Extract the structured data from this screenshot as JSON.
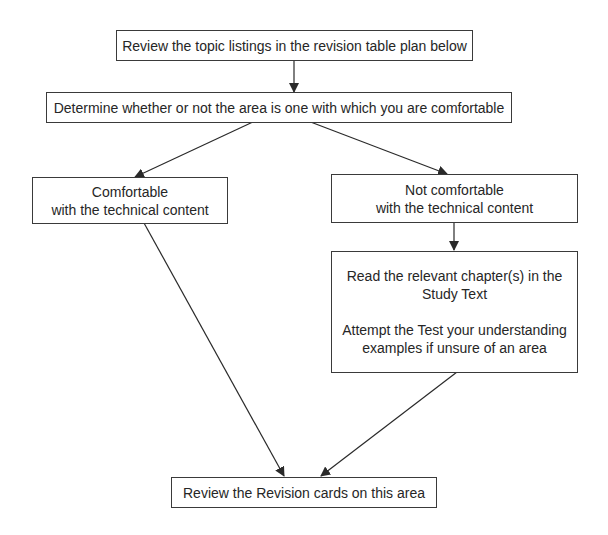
{
  "diagram": {
    "type": "flowchart",
    "colors": {
      "background": "#ffffff",
      "border": "#3a3a3a",
      "text": "#262626",
      "arrow": "#2a2a2a"
    },
    "nodes": {
      "review_topics": {
        "lines": [
          "Review the topic listings in the revision table plan below"
        ]
      },
      "determine": {
        "lines": [
          "Determine whether or not the area is one with which you are comfortable"
        ]
      },
      "comfortable": {
        "lines": [
          "Comfortable",
          "with the technical content"
        ]
      },
      "not_comfortable": {
        "lines": [
          "Not comfortable",
          "with the technical content"
        ]
      },
      "read_study": {
        "lines": [
          "Read the relevant chapter(s) in the",
          "Study Text",
          "Attempt the Test your understanding",
          "examples if unsure of an area"
        ]
      },
      "review_cards": {
        "lines": [
          "Review the Revision cards on this area"
        ]
      }
    },
    "edges": [
      {
        "from": "review_topics",
        "to": "determine"
      },
      {
        "from": "determine",
        "to": "comfortable"
      },
      {
        "from": "determine",
        "to": "not_comfortable"
      },
      {
        "from": "not_comfortable",
        "to": "read_study"
      },
      {
        "from": "comfortable",
        "to": "review_cards"
      },
      {
        "from": "read_study",
        "to": "review_cards"
      }
    ]
  }
}
